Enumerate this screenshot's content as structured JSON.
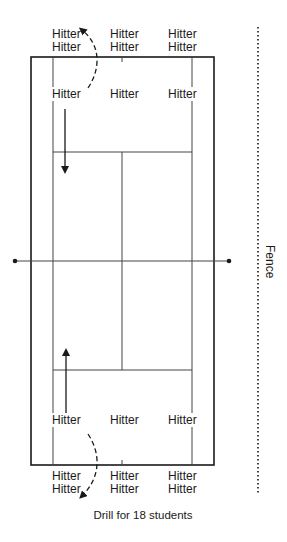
{
  "caption": "Drill for 18 students",
  "fence_label": "Fence",
  "players": {
    "top_row1": [
      "Hitter",
      "Hitter",
      "Hitter"
    ],
    "top_row2": [
      "Hitter",
      "Hitter",
      "Hitter"
    ],
    "top_service": [
      "Hitter",
      "Hitter",
      "Hitter"
    ],
    "bottom_service": [
      "Hitter",
      "Hitter",
      "Hitter"
    ],
    "bottom_row1": [
      "Hitter",
      "Hitter",
      "Hitter"
    ],
    "bottom_row2": [
      "Hitter",
      "Hitter",
      "Hitter"
    ]
  },
  "colors": {
    "line": "#1a1a1a",
    "inner_line": "#555555",
    "background": "#ffffff"
  }
}
